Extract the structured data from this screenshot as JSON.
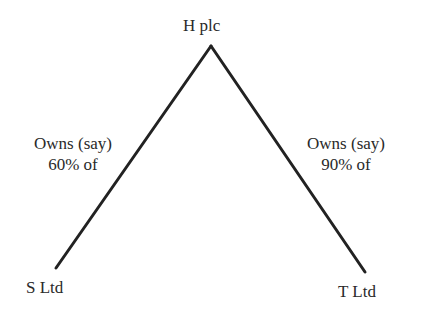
{
  "diagram": {
    "parent": {
      "label": "H plc"
    },
    "subsidiaries": [
      {
        "label": "S Ltd",
        "edge_label_line1": "Owns (say)",
        "edge_label_line2": "60% of"
      },
      {
        "label": "T Ltd",
        "edge_label_line1": "Owns (say)",
        "edge_label_line2": "90% of"
      }
    ],
    "line_color": "#222222"
  }
}
